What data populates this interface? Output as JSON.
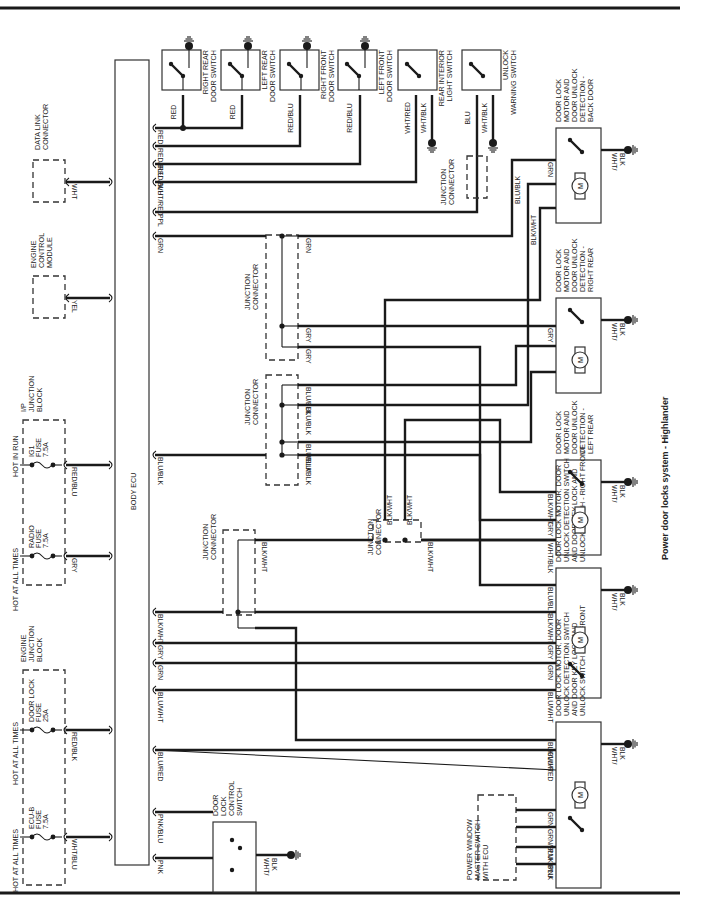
{
  "caption": "Power door locks system - Highlander",
  "body_ecu": {
    "label": "BODY ECU"
  },
  "power_sources": [
    {
      "id": "ig1",
      "condition": "HOT IN RUN",
      "fuse": [
        "IG1",
        "FUSE",
        "7.5A"
      ],
      "wire": "RED/BLU"
    },
    {
      "id": "radio",
      "condition": "HOT AT ALL TIMES",
      "fuse": [
        "RADIO",
        "FUSE",
        "7.5A"
      ],
      "wire": "GRY"
    },
    {
      "id": "doorlock",
      "condition": "HOT AT ALL TIMES",
      "fuse": [
        "DOOR LOCK",
        "FUSE",
        "25A"
      ],
      "wire": "RED/BLK"
    },
    {
      "id": "ecub",
      "condition": "HOT AT ALL TIMES",
      "fuse": [
        "ECU-B",
        "FUSE",
        "7.5A"
      ],
      "wire": "WHT/BLU"
    }
  ],
  "blocks": {
    "ip_junction": [
      "I/P",
      "JUNCTION",
      "BLOCK"
    ],
    "engine_junction": [
      "ENGINE",
      "JUNCTION",
      "BLOCK"
    ],
    "data_link": [
      "DATA LINK",
      "CONNECTOR"
    ],
    "ecm": [
      "ENGINE",
      "CONTROL",
      "MODULE"
    ],
    "power_window": [
      "POWER WINDOW",
      "MASTER SWITCH",
      "WITH ECU"
    ],
    "junction_connector": [
      "JUNCTION",
      "CONNECTOR"
    ]
  },
  "ecu_side_wires": {
    "data_link": "WHT",
    "ecm": "YEL"
  },
  "door_switches": [
    {
      "name": [
        "RIGHT REAR",
        "DOOR SWITCH"
      ],
      "wires": [
        "RED"
      ]
    },
    {
      "name": [
        "LEFT REAR",
        "DOOR SWITCH"
      ],
      "wires": [
        "RED"
      ]
    },
    {
      "name": [
        "RIGHT FRONT",
        "DOOR SWITCH"
      ],
      "wires": [
        "RED/BLU"
      ]
    },
    {
      "name": [
        "LEFT FRONT",
        "DOOR SWITCH"
      ],
      "wires": [
        "RED/BLU"
      ]
    },
    {
      "name": [
        "REAR INTERIOR",
        "LIGHT SWITCH"
      ],
      "wires": [
        "WHT/RED",
        "WHT/BLK"
      ]
    },
    {
      "name": [
        "UNLOCK",
        "WARNING SWITCH"
      ],
      "wires": [
        "BLU",
        "WHT/BLK"
      ]
    }
  ],
  "ecu_wires": [
    "RED",
    "RED/BLU",
    "RED/BLU",
    "WHT/RED",
    "PPL",
    "GRN",
    "BLU/BLK",
    "BLK/WHT",
    "GRY",
    "GRN",
    "BLU/WHT",
    "BLU/RED",
    "PNK/BLU",
    "PNK"
  ],
  "junction_wires": {
    "grn_gry": [
      "GRN",
      "GRY",
      "GRY"
    ],
    "blu_blk": [
      "BLU/BLK",
      "BLU/BLK",
      "BLU/BLK",
      "BLU/BLK"
    ],
    "blk_wht": "BLK/WHT",
    "center": [
      "BLK/WHT",
      "BLK/WHT",
      "BLK/WHT"
    ]
  },
  "actuators": [
    {
      "name": [
        "DOOR LOCK",
        "MOTOR AND",
        "DOOR UNLOCK",
        "DETECTION -",
        "BACK DOOR"
      ],
      "wires": [
        "GRN",
        "BLU/BLK",
        "BLK/WHT"
      ],
      "ground": [
        "WHT/",
        "BLK"
      ]
    },
    {
      "name": [
        "DOOR LOCK",
        "MOTOR AND",
        "DOOR UNLOCK",
        "DETECTION -",
        "RIGHT REAR"
      ],
      "wires": [
        "GRY"
      ],
      "ground": [
        "WHT/",
        "BLK"
      ]
    },
    {
      "name": [
        "DOOR LOCK",
        "MOTOR AND",
        "DOOR UNLOCK",
        "DETECTION -",
        "LEFT REAR"
      ],
      "wires": [
        "BLK/WHT",
        "GRY",
        "WHT/BLK"
      ],
      "ground": [
        "WHT/",
        "BLK"
      ]
    },
    {
      "name": [
        "DOOR LOCK MOTOR, DOOR",
        "UNLOCK DETECTION SWITCH",
        "AND DOOR KEY LOCK AND",
        "UNLOCK SWITCH - RIGHT FRONT"
      ],
      "wires": [
        "BLU/BLK",
        "BLK/WHT",
        "GRY",
        "GRN",
        "BLU/WHT"
      ],
      "ground": [
        "WHT/",
        "BLK"
      ]
    },
    {
      "name": [
        "DOOR LOCK MOTOR, DOOR",
        "UNLOCK DETECTION SWITCH",
        "AND DOOR KEY LOCK AND",
        "UNLOCK SWITCH - LEFT FRONT"
      ],
      "wires": [
        "BLK/WHT",
        "BLU/RED",
        "GRN",
        "GRN/BLU",
        "PNK/BLU",
        "PNK"
      ],
      "ground": [
        "WHT/",
        "BLK"
      ]
    }
  ],
  "control_switch": {
    "name": [
      "DOOR",
      "LOCK",
      "CONTROL",
      "SWITCH"
    ],
    "ground": [
      "WHT/",
      "BLK"
    ]
  },
  "motor_symbol": "M"
}
